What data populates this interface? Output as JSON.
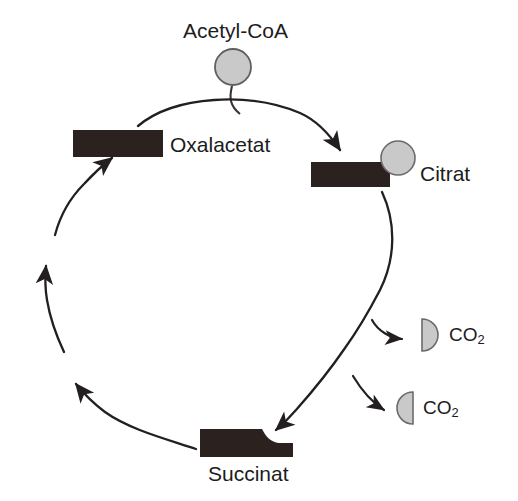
{
  "diagram": {
    "type": "cycle-diagram",
    "background_color": "#ffffff",
    "block_color": "#2b2220",
    "sphere_fill": "#c9c9c9",
    "sphere_stroke": "#6b6b6b",
    "arrow_color": "#231f20",
    "text_color": "#1c1c1c"
  },
  "nodes": {
    "acetyl_coa": {
      "label": "Acetyl-CoA",
      "shape": "circle",
      "shape_name": "carbon-sphere",
      "cx": 233,
      "cy": 67,
      "r": 18
    },
    "oxalacetat": {
      "label": "Oxalacetat",
      "shape": "rectangle",
      "shape_name": "carbon-block",
      "x": 73,
      "y": 130,
      "w": 90,
      "h": 27
    },
    "citrat": {
      "label": "Citrat",
      "shape": "rectangle-with-sphere",
      "shape_name": "carbon-block",
      "x": 311,
      "y": 162,
      "w": 79,
      "h": 25,
      "sphere": {
        "cx": 398,
        "cy": 158,
        "r": 17
      }
    },
    "succinat": {
      "label": "Succinat",
      "shape": "rectangle-notched",
      "shape_name": "carbon-block",
      "x": 200,
      "y": 429,
      "w": 93,
      "h": 28
    },
    "co2_first": {
      "label": "CO",
      "subscript": "2",
      "shape": "right-semicircle",
      "shape_name": "carbon-half-sphere",
      "cx": 430,
      "cy": 335,
      "r": 16
    },
    "co2_second": {
      "label": "CO",
      "subscript": "2",
      "shape": "left-semicircle",
      "shape_name": "carbon-half-sphere",
      "cx": 413,
      "cy": 408,
      "r": 16
    }
  },
  "edges": [
    {
      "name": "acetyl-coa-to-citrat",
      "from": "acetyl_coa",
      "to": "citrat",
      "style": "curved-arrow"
    },
    {
      "name": "oxalacetat-to-citrat",
      "from": "oxalacetat",
      "to": "citrat",
      "style": "curved-arrow"
    },
    {
      "name": "citrat-to-co2-first",
      "from": "citrat",
      "to": "co2_first",
      "style": "branch-arrow"
    },
    {
      "name": "citrat-to-co2-second",
      "from": "citrat",
      "to": "co2_second",
      "style": "branch-arrow"
    },
    {
      "name": "citrat-to-succinat",
      "from": "citrat",
      "to": "succinat",
      "style": "curved-arrow"
    },
    {
      "name": "succinat-to-oxalacetat-lower",
      "from": "succinat",
      "to": "oxalacetat",
      "style": "curved-arrow"
    },
    {
      "name": "succinat-to-oxalacetat-mid",
      "from": "succinat",
      "to": "oxalacetat",
      "style": "curved-arrow"
    },
    {
      "name": "succinat-to-oxalacetat-upper",
      "from": "succinat",
      "to": "oxalacetat",
      "style": "curved-arrow"
    }
  ]
}
